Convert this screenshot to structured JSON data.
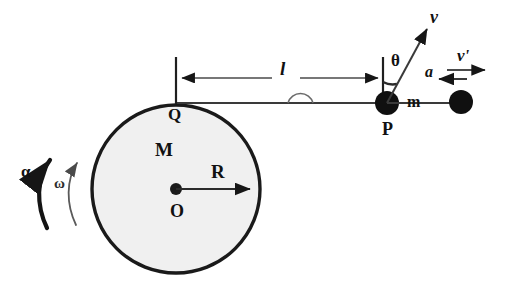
{
  "figure": {
    "type": "physics-diagram",
    "background_color": "#ffffff",
    "ink_color": "#111111",
    "disk_fill_color": "#f0f0f0",
    "disk_outline_color": "#1a1a1a",
    "secondary_ink_color": "#555555"
  },
  "labels": {
    "disk_mass": "M",
    "disk_radius": "R",
    "disk_center": "O",
    "rim_point": "Q",
    "angular_acceleration": "α",
    "angular_velocity": "ω",
    "rod_length": "l",
    "angle": "θ",
    "velocity": "v",
    "velocity_prime": "v'",
    "acceleration": "a",
    "particle_mass": "m",
    "particle_point": "P"
  },
  "geometry": {
    "disk": {
      "cx": 176,
      "cy": 189,
      "r": 84
    },
    "center_dot": {
      "cx": 176,
      "cy": 189,
      "r": 6
    },
    "rim_point_Q": {
      "x": 176,
      "y": 105
    },
    "radius_arrow": {
      "x1": 176,
      "y1": 189,
      "x2": 256,
      "y2": 189
    },
    "rod": {
      "x1": 176,
      "y1": 103,
      "x2": 387,
      "y2": 103
    },
    "rod_bump": {
      "cx": 300,
      "cy": 103,
      "r": 13
    },
    "particle_P": {
      "cx": 387,
      "cy": 103,
      "r": 12
    },
    "particle_2": {
      "cx": 461,
      "cy": 102,
      "r": 12
    },
    "tail_rod": {
      "x1": 387,
      "y1": 103,
      "x2": 461,
      "y2": 103
    },
    "dimension_line": {
      "x1": 176,
      "y1": 78,
      "x2": 383,
      "y2": 78
    },
    "tick_left": {
      "x": 176,
      "y1": 58,
      "y2": 104
    },
    "tick_right": {
      "x": 383,
      "y1": 58,
      "y2": 103
    },
    "velocity_arrow": {
      "x1": 387,
      "y1": 103,
      "x2": 428,
      "y2": 26
    },
    "theta_arc": {
      "cx": 387,
      "cy": 103,
      "r": 21
    },
    "vprime_arrow": {
      "x1": 447,
      "y1": 70,
      "x2": 489,
      "y2": 70
    },
    "a_arrow": {
      "x1": 467,
      "y1": 79,
      "x2": 435,
      "y2": 79
    },
    "alpha_arc": {
      "start": [
        47,
        228
      ],
      "end": [
        55,
        155
      ]
    },
    "omega_arc": {
      "start": [
        75,
        224
      ],
      "end": [
        80,
        158
      ]
    }
  }
}
